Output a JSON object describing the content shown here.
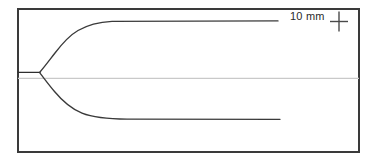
{
  "figure": {
    "title": "",
    "background_color": "#ffffff",
    "frame": {
      "name": "plot-frame",
      "x": 17,
      "y": 8,
      "width": 343,
      "height": 145,
      "stroke_color": "#3a3a3a",
      "stroke_width": 2
    },
    "annotation": {
      "scale_label": "10 mm",
      "scale_label_color": "#2b2b2b",
      "marker_icon": "crosshair-plus-icon",
      "marker_color": "#4a4a4a",
      "marker_center_x": 339,
      "marker_center_y": 21,
      "marker_arm_h": 9,
      "marker_arm_v": 10
    },
    "curves": [
      {
        "name": "inlet-stem",
        "color": "#2f2f2f",
        "width": 1.2,
        "path": "M 17,72.2 L 39.5,72.4"
      },
      {
        "name": "upper-branch",
        "color": "#3a3a3a",
        "width": 1.3,
        "path": "M 39.5,72.2 C 47,64 52,57 59,49 C 66,41 73,34 82,28.5 C 91,23.5 101,21.6 112,21.2 L 278,20.8"
      },
      {
        "name": "lower-branch",
        "color": "#3a3a3a",
        "width": 1.3,
        "path": "M 39.5,72.8 C 46,80 51,86 58,93 C 66,101 75,109 87,113.6 C 99,118 114,119 128,119.1 L 280,119.2"
      },
      {
        "name": "centerline-axis",
        "color": "#c9c9c9",
        "width": 1.1,
        "path": "M 17,78.4 L 360,78.4"
      }
    ]
  }
}
